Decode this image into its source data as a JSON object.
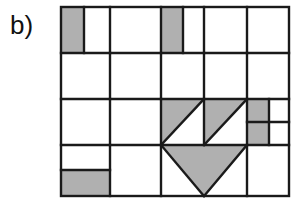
{
  "figure": {
    "panel_label": "b)",
    "caption": "",
    "colors": {
      "shade_fill": "#b0b0b0",
      "empty_fill": "#ffffff",
      "stroke": "#1a1a1a",
      "background": "#ffffff",
      "label_color": "#111111"
    },
    "geometry": {
      "outer_rect": {
        "x": 61,
        "y": 7,
        "width": 228,
        "height": 189
      },
      "stroke_width": 2.4,
      "column_lines_x": [
        61,
        110,
        161,
        204,
        247,
        289
      ],
      "row_lines_y": [
        7,
        53,
        99,
        145,
        196
      ]
    },
    "shaded_rects": [
      {
        "name": "r1c1-left-strip",
        "x": 61,
        "y": 7,
        "width": 23,
        "height": 46
      },
      {
        "name": "r1c3-left-strip",
        "x": 161,
        "y": 7,
        "width": 22,
        "height": 46
      },
      {
        "name": "r5c1-block",
        "x": 61,
        "y": 170,
        "width": 49,
        "height": 26
      },
      {
        "name": "r3c5-block",
        "x": 247,
        "y": 99,
        "width": 22,
        "height": 46
      },
      {
        "name": "r3c4-bg",
        "x": 204,
        "y": 99,
        "width": 43,
        "height": 46
      },
      {
        "name": "r3c3-bg",
        "x": 161,
        "y": 99,
        "width": 43,
        "height": 46
      },
      {
        "name": "r4c3-bg",
        "x": 161,
        "y": 145,
        "width": 43,
        "height": 51
      },
      {
        "name": "r4c4-bg",
        "x": 204,
        "y": 145,
        "width": 43,
        "height": 51
      }
    ],
    "white_triangles": [
      {
        "name": "r3c3-lower-right-white",
        "points": "161,145 204,145 204,99"
      },
      {
        "name": "r3c4-lower-right-white",
        "points": "204,145 247,145 247,99"
      },
      {
        "name": "r4c3-upper-left-white",
        "points": "161,145 204,196 161,196"
      },
      {
        "name": "r4c4-upper-right-white",
        "points": "247,145 204,196 247,196"
      }
    ],
    "internal_lines": [
      {
        "name": "r1c1-strip-divider",
        "x1": 84,
        "y1": 7,
        "x2": 84,
        "y2": 53
      },
      {
        "name": "r1c3-strip-divider",
        "x1": 183,
        "y1": 7,
        "x2": 183,
        "y2": 53
      },
      {
        "name": "r1-col-div-1",
        "x1": 110,
        "y1": 7,
        "x2": 110,
        "y2": 53
      },
      {
        "name": "r1-col-div-2",
        "x1": 161,
        "y1": 7,
        "x2": 161,
        "y2": 53
      },
      {
        "name": "r1-col-div-3",
        "x1": 204,
        "y1": 7,
        "x2": 204,
        "y2": 53
      },
      {
        "name": "r1-col-div-4",
        "x1": 247,
        "y1": 7,
        "x2": 247,
        "y2": 53
      },
      {
        "name": "r2-col-div-1",
        "x1": 110,
        "y1": 53,
        "x2": 110,
        "y2": 99
      },
      {
        "name": "r2-col-div-2",
        "x1": 161,
        "y1": 53,
        "x2": 161,
        "y2": 99
      },
      {
        "name": "r2-col-div-3",
        "x1": 204,
        "y1": 53,
        "x2": 204,
        "y2": 99
      },
      {
        "name": "r2-col-div-4",
        "x1": 247,
        "y1": 53,
        "x2": 247,
        "y2": 99
      },
      {
        "name": "r3-col-div-1",
        "x1": 110,
        "y1": 99,
        "x2": 110,
        "y2": 145
      },
      {
        "name": "r3-col-div-2",
        "x1": 161,
        "y1": 99,
        "x2": 161,
        "y2": 145
      },
      {
        "name": "r3-col-div-3",
        "x1": 204,
        "y1": 99,
        "x2": 204,
        "y2": 145
      },
      {
        "name": "r3-col-div-4",
        "x1": 247,
        "y1": 99,
        "x2": 247,
        "y2": 145
      },
      {
        "name": "r3c5-right-div",
        "x1": 269,
        "y1": 99,
        "x2": 269,
        "y2": 145
      },
      {
        "name": "r4-col-div-1",
        "x1": 110,
        "y1": 145,
        "x2": 110,
        "y2": 196
      },
      {
        "name": "r4-col-div-2",
        "x1": 161,
        "y1": 145,
        "x2": 161,
        "y2": 196
      },
      {
        "name": "r4-col-div-3",
        "x1": 247,
        "y1": 145,
        "x2": 247,
        "y2": 196
      },
      {
        "name": "row-div-1",
        "x1": 61,
        "y1": 53,
        "x2": 289,
        "y2": 53
      },
      {
        "name": "row-div-2",
        "x1": 61,
        "y1": 99,
        "x2": 289,
        "y2": 99
      },
      {
        "name": "row-div-3",
        "x1": 61,
        "y1": 145,
        "x2": 289,
        "y2": 145
      },
      {
        "name": "r4c1-split",
        "x1": 61,
        "y1": 170,
        "x2": 110,
        "y2": 170
      },
      {
        "name": "r3c5-split",
        "x1": 247,
        "y1": 122,
        "x2": 289,
        "y2": 122
      },
      {
        "name": "diag-r3c3",
        "x1": 161,
        "y1": 145,
        "x2": 204,
        "y2": 99
      },
      {
        "name": "diag-r3c4",
        "x1": 204,
        "y1": 145,
        "x2": 247,
        "y2": 99
      },
      {
        "name": "diag-r4c3",
        "x1": 161,
        "y1": 145,
        "x2": 204,
        "y2": 196
      },
      {
        "name": "diag-r4c4",
        "x1": 247,
        "y1": 145,
        "x2": 204,
        "y2": 196
      }
    ]
  }
}
